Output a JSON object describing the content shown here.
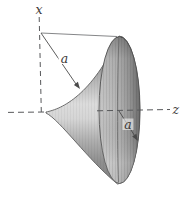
{
  "figure": {
    "labels": {
      "x_axis": "x",
      "z_axis": "z",
      "slant_radius": "a",
      "bell_radius": "a"
    },
    "colors": {
      "background": "#ffffff",
      "axis_line": "#58595b",
      "reference_line": "#77787a",
      "arrow": "#4a4a4a",
      "label_text": "#3d3a38",
      "surface_outline": "#606060",
      "bell_rim": "#565656",
      "surface_light": "#dadada",
      "surface_mid": "#a9a9a9",
      "surface_dark": "#7b7b7b"
    }
  }
}
